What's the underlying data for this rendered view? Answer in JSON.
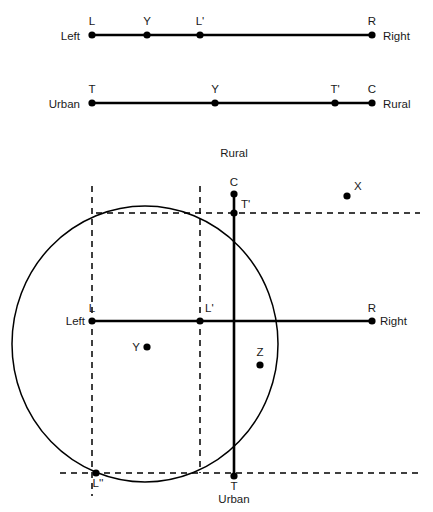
{
  "figure": {
    "background": "#ffffff",
    "stroke": "#000000",
    "text_color": "#1a1a1a"
  },
  "axis1": {
    "name": "left-right-axis",
    "left_label": "Left",
    "right_label": "Right",
    "points": [
      {
        "id": "L",
        "label": "L",
        "x": 92,
        "y": 35
      },
      {
        "id": "Y",
        "label": "Y",
        "x": 147,
        "y": 35
      },
      {
        "id": "Lp",
        "label": "L'",
        "x": 200,
        "y": 35
      },
      {
        "id": "R",
        "label": "R",
        "x": 372,
        "y": 35
      }
    ],
    "dashed_tick_at": "L'",
    "line": {
      "x1": 92,
      "x2": 372,
      "y": 35
    }
  },
  "axis2": {
    "name": "urban-rural-axis",
    "left_label": "Urban",
    "right_label": "Rural",
    "points": [
      {
        "id": "T",
        "label": "T",
        "x": 92,
        "y": 103
      },
      {
        "id": "Y",
        "label": "Y",
        "x": 215,
        "y": 103
      },
      {
        "id": "Tp",
        "label": "T'",
        "x": 335,
        "y": 103
      },
      {
        "id": "C",
        "label": "C",
        "x": 372,
        "y": 103
      }
    ],
    "dashed_tick_at": "T'",
    "line": {
      "x1": 92,
      "x2": 372,
      "y": 103
    }
  },
  "main": {
    "name": "two-dimensional-space",
    "axis_labels": {
      "top": "Rural",
      "bottom": "Urban",
      "left": "Left",
      "right": "Right"
    },
    "horizontal_axis": {
      "x1": 92,
      "x2": 372,
      "y": 321
    },
    "vertical_axis": {
      "x": 234,
      "y1": 194,
      "y2": 476
    },
    "ellipse": {
      "cx": 145,
      "cy": 344,
      "rx": 133,
      "ry": 138
    },
    "points": [
      {
        "id": "C",
        "label": "C",
        "x": 234,
        "y": 194,
        "dot": true,
        "label_dx": 0,
        "label_dy": -8,
        "anchor": "middle"
      },
      {
        "id": "Tp",
        "label": "T'",
        "x": 234,
        "y": 213,
        "dot": true,
        "label_dx": 7,
        "label_dy": -5,
        "anchor": "start"
      },
      {
        "id": "X",
        "label": "X",
        "x": 347,
        "y": 196,
        "dot": true,
        "label_dx": 7,
        "label_dy": -6,
        "anchor": "start"
      },
      {
        "id": "L",
        "label": "L",
        "x": 92,
        "y": 321,
        "dot": true,
        "label_dx": 0,
        "label_dy": -9,
        "anchor": "middle"
      },
      {
        "id": "Lp",
        "label": "L'",
        "x": 200,
        "y": 321,
        "dot": true,
        "label_dx": 5,
        "label_dy": -9,
        "anchor": "start"
      },
      {
        "id": "R",
        "label": "R",
        "x": 372,
        "y": 321,
        "dot": true,
        "label_dx": 0,
        "label_dy": -9,
        "anchor": "middle"
      },
      {
        "id": "Y",
        "label": "Y",
        "x": 147,
        "y": 347,
        "dot": true,
        "label_dx": -7,
        "label_dy": 4,
        "anchor": "end"
      },
      {
        "id": "Z",
        "label": "Z",
        "x": 260,
        "y": 365,
        "dot": true,
        "label_dx": 0,
        "label_dy": -9,
        "anchor": "middle"
      },
      {
        "id": "Lpp",
        "label": "L''",
        "x": 96,
        "y": 473,
        "dot": true,
        "label_dx": 2,
        "label_dy": 14,
        "anchor": "middle"
      },
      {
        "id": "T",
        "label": "T",
        "x": 234,
        "y": 476,
        "dot": true,
        "label_dx": 0,
        "label_dy": 14,
        "anchor": "middle"
      }
    ],
    "dashed_vertical_lines": [
      {
        "x": 92,
        "y1": 186,
        "y2": 496
      },
      {
        "x": 200,
        "y1": 186,
        "y2": 473
      }
    ],
    "dashed_horizontal_lines": [
      {
        "y": 213,
        "x1": 96,
        "x2": 420
      },
      {
        "y": 473,
        "x1": 60,
        "x2": 420
      }
    ],
    "outer_labels": [
      {
        "id": "rural-top",
        "text": "Rural",
        "x": 234,
        "y": 157,
        "anchor": "middle"
      },
      {
        "id": "urban-bottom",
        "text": "Urban",
        "x": 234,
        "y": 503,
        "anchor": "middle"
      },
      {
        "id": "left-side",
        "text": "Left",
        "x": 85,
        "y": 325,
        "anchor": "end"
      },
      {
        "id": "right-side",
        "text": "Right",
        "x": 380,
        "y": 325,
        "anchor": "start"
      }
    ]
  }
}
